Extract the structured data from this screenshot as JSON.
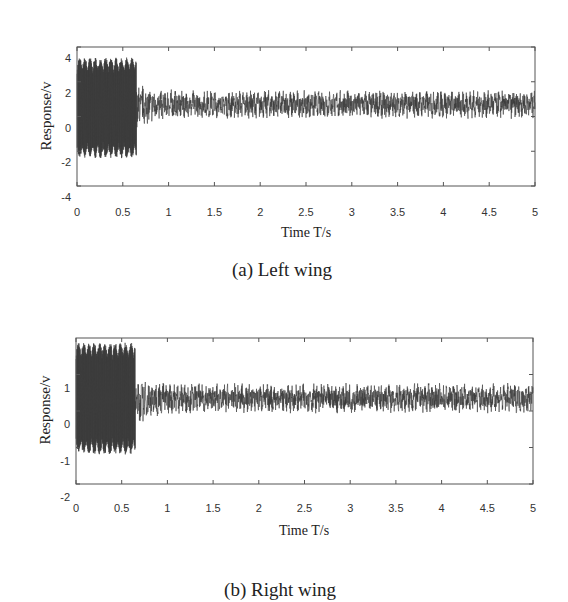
{
  "chart_data": [
    {
      "type": "line",
      "caption": "(a) Left wing",
      "title": "",
      "xlabel": "Time T/s",
      "ylabel": "Response/v",
      "xlim": [
        0,
        5
      ],
      "ylim": [
        -4,
        4
      ],
      "xticks": [
        "0",
        "0.5",
        "1",
        "1.5",
        "2",
        "2.5",
        "3",
        "3.5",
        "4",
        "4.5",
        "5"
      ],
      "yticks": [
        "4",
        "2",
        "0",
        "-2",
        "-4"
      ],
      "grid": false,
      "legend": null,
      "series": [
        {
          "name": "Left wing response",
          "description": "High-amplitude oscillation from 0 to ~0.65 s, then settles into a narrow noisy band",
          "segments": [
            {
              "t_start": 0,
              "t_end": 0.65,
              "min": -2.4,
              "max": 3.4
            },
            {
              "t_start": 0.65,
              "t_end": 5,
              "min": 0.0,
              "max": 1.6,
              "mean": 0.7
            }
          ]
        }
      ]
    },
    {
      "type": "line",
      "caption": "(b) Right wing",
      "title": "",
      "xlabel": "Time T/s",
      "ylabel": "Response/v",
      "xlim": [
        0,
        5
      ],
      "ylim": [
        -2,
        2
      ],
      "xticks": [
        "0",
        "0.5",
        "1",
        "1.5",
        "2",
        "2.5",
        "3",
        "3.5",
        "4",
        "4.5",
        "5"
      ],
      "yticks": [
        "1",
        "0",
        "-1",
        "-2"
      ],
      "grid": false,
      "legend": null,
      "series": [
        {
          "name": "Right wing response",
          "description": "High-amplitude oscillation from 0 to ~0.65 s, then settles into a narrow noisy band",
          "segments": [
            {
              "t_start": 0,
              "t_end": 0.65,
              "min": -1.2,
              "max": 1.9
            },
            {
              "t_start": 0.65,
              "t_end": 5,
              "min": 0.0,
              "max": 0.8,
              "mean": 0.35
            }
          ]
        }
      ]
    }
  ],
  "layout": {
    "plots": [
      {
        "left": 77,
        "right": 535,
        "top": 47,
        "bottom": 186,
        "ytick_positions": [
          45.5,
          81,
          116.5,
          152,
          187.5
        ],
        "ytick_label_offset": 11,
        "ylabel_x": 46,
        "ylabel_y": 116,
        "xtick_label_y": 212,
        "xlabel_y": 233,
        "caption_y": 270,
        "signal_color": "#3a3a3a"
      },
      {
        "left": 76,
        "right": 533,
        "top": 338,
        "bottom": 484,
        "ytick_positions": [
          374,
          410.5,
          447,
          483.5
        ],
        "ytick_label_offset": 13,
        "ylabel_x": 45,
        "ylabel_y": 410,
        "xtick_label_y": 508,
        "xlabel_y": 531,
        "caption_y": 590,
        "signal_color": "#3a3a3a"
      }
    ]
  }
}
